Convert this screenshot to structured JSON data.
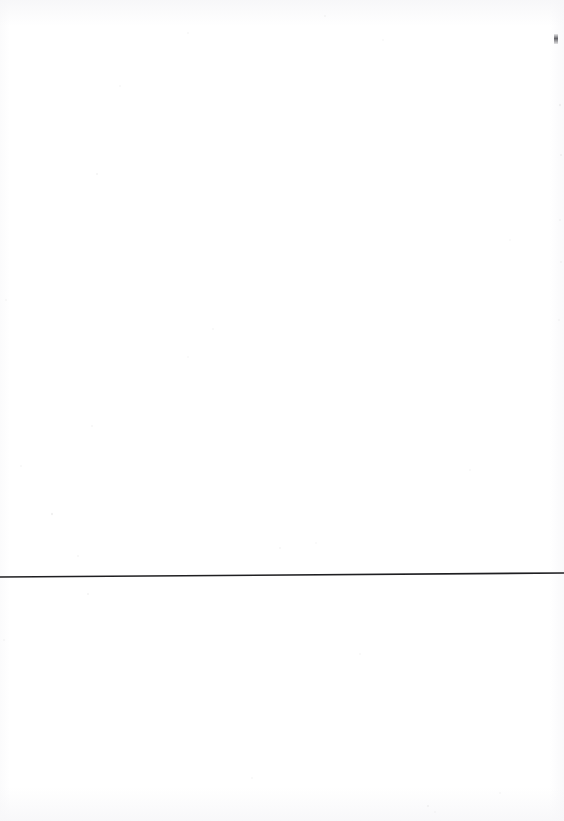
{
  "document": {
    "kind": "scanned-page",
    "page_width": 564,
    "page_height": 821,
    "background_color": "#ffffff",
    "text_content": "",
    "visible_text_blocks": [],
    "description_label": ""
  },
  "marks": {
    "horizontal_rule": {
      "name": "horizontal-rule",
      "color": "#1f1f22",
      "thickness_px": 1.6,
      "x_start": 0,
      "y_start": 577,
      "x_end": 564,
      "y_end": 573,
      "spans_full_width": true
    },
    "edge_speck": {
      "name": "ink-speck",
      "color": "#4a4a50",
      "x": 554,
      "y": 34,
      "width_px": 4,
      "height_px": 10
    }
  },
  "noise": {
    "specks": [
      {
        "x": 97,
        "y": 174,
        "r": 1.1,
        "o": 0.1
      },
      {
        "x": 325,
        "y": 16,
        "r": 1.0,
        "o": 0.09
      },
      {
        "x": 383,
        "y": 40,
        "r": 0.9,
        "o": 0.08
      },
      {
        "x": 188,
        "y": 33,
        "r": 1.0,
        "o": 0.08
      },
      {
        "x": 560,
        "y": 105,
        "r": 1.2,
        "o": 0.11
      },
      {
        "x": 561,
        "y": 155,
        "r": 1.1,
        "o": 0.1
      },
      {
        "x": 560,
        "y": 220,
        "r": 1.0,
        "o": 0.09
      },
      {
        "x": 561,
        "y": 262,
        "r": 1.0,
        "o": 0.09
      },
      {
        "x": 559,
        "y": 320,
        "r": 1.0,
        "o": 0.08
      },
      {
        "x": 92,
        "y": 426,
        "r": 1.0,
        "o": 0.09
      },
      {
        "x": 188,
        "y": 357,
        "r": 0.9,
        "o": 0.08
      },
      {
        "x": 213,
        "y": 329,
        "r": 1.0,
        "o": 0.08
      },
      {
        "x": 280,
        "y": 548,
        "r": 1.0,
        "o": 0.09
      },
      {
        "x": 316,
        "y": 543,
        "r": 0.9,
        "o": 0.08
      },
      {
        "x": 52,
        "y": 514,
        "r": 1.2,
        "o": 0.12
      },
      {
        "x": 78,
        "y": 556,
        "r": 1.0,
        "o": 0.09
      },
      {
        "x": 21,
        "y": 466,
        "r": 1.0,
        "o": 0.08
      },
      {
        "x": 88,
        "y": 594,
        "r": 1.1,
        "o": 0.1
      },
      {
        "x": 360,
        "y": 654,
        "r": 1.0,
        "o": 0.08
      },
      {
        "x": 252,
        "y": 778,
        "r": 1.0,
        "o": 0.08
      },
      {
        "x": 428,
        "y": 806,
        "r": 1.1,
        "o": 0.1
      },
      {
        "x": 435,
        "y": 812,
        "r": 0.9,
        "o": 0.08
      },
      {
        "x": 500,
        "y": 793,
        "r": 0.9,
        "o": 0.07
      },
      {
        "x": 6,
        "y": 300,
        "r": 1.0,
        "o": 0.08
      },
      {
        "x": 4,
        "y": 640,
        "r": 1.0,
        "o": 0.07
      },
      {
        "x": 120,
        "y": 86,
        "r": 0.9,
        "o": 0.07
      },
      {
        "x": 470,
        "y": 470,
        "r": 0.9,
        "o": 0.07
      },
      {
        "x": 510,
        "y": 240,
        "r": 0.9,
        "o": 0.06
      }
    ]
  }
}
